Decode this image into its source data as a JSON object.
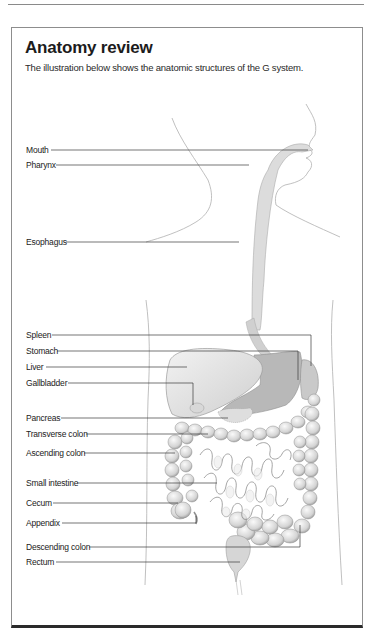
{
  "document": {
    "title": "Anatomy review",
    "intro": "The illustration below shows the anatomic structures of the G  system."
  },
  "illustration": {
    "subject": "gastrointestinal-system",
    "labels": [
      {
        "text": "Mouth",
        "y": 150
      },
      {
        "text": "Pharynx",
        "y": 165
      },
      {
        "text": "Esophagus",
        "y": 242
      },
      {
        "text": "Spleen",
        "y": 335
      },
      {
        "text": "Stomach",
        "y": 351
      },
      {
        "text": "Liver",
        "y": 367
      },
      {
        "text": "Gallbladder",
        "y": 383
      },
      {
        "text": "Pancreas",
        "y": 418
      },
      {
        "text": "Transverse colon",
        "y": 434
      },
      {
        "text": "Ascending colon",
        "y": 453
      },
      {
        "text": "Small intestine",
        "y": 483
      },
      {
        "text": "Cecum",
        "y": 503
      },
      {
        "text": "Appendix",
        "y": 523
      },
      {
        "text": "Descending colon",
        "y": 547
      },
      {
        "text": "Rectum",
        "y": 562
      }
    ]
  },
  "colors": {
    "rule": "#8a8a8a",
    "border": "#8d8d8d",
    "bottom_border": "#2a2a2a",
    "leader_line": "#3a3a3a",
    "outline": "#a8a8a8",
    "organ_fill": "#e2e2e2",
    "organ_dark": "#bdbdbd"
  }
}
